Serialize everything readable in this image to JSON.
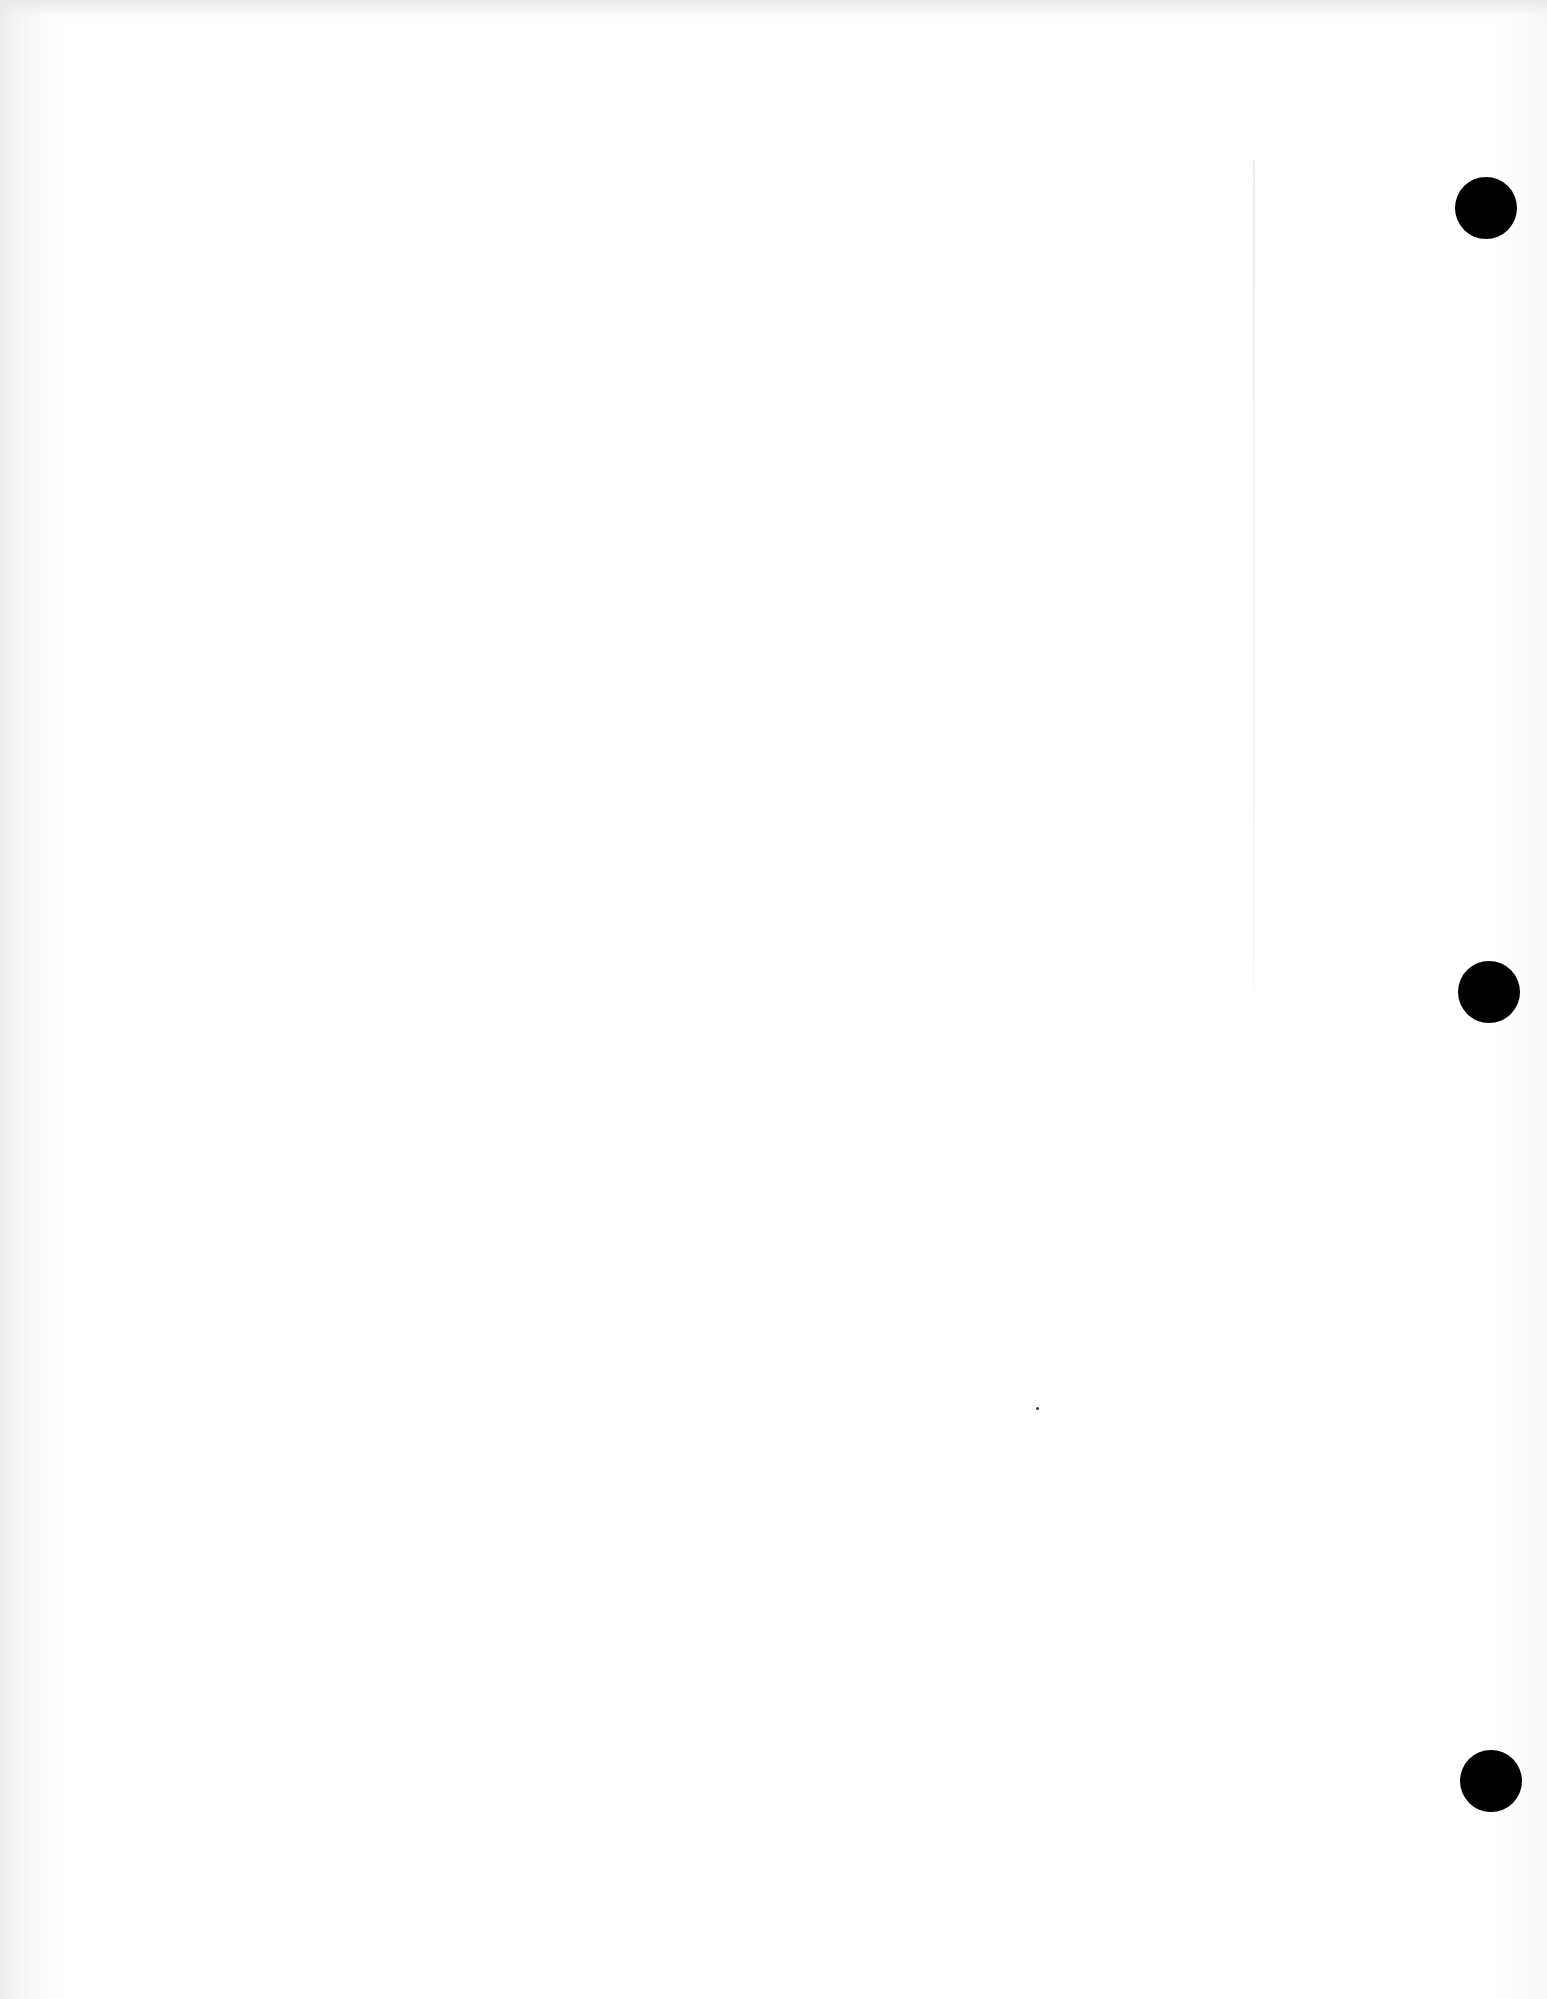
{
  "document": {
    "type": "blank scanned page",
    "text": "",
    "colors": {
      "paper": "#ffffff",
      "edge_shadow": "#ececec",
      "punch_hole": "#000000"
    },
    "punch_holes": [
      {
        "cx": 1486,
        "cy": 208,
        "r": 31
      },
      {
        "cx": 1489,
        "cy": 992,
        "r": 31
      },
      {
        "cx": 1491,
        "cy": 1781,
        "r": 31
      }
    ]
  }
}
